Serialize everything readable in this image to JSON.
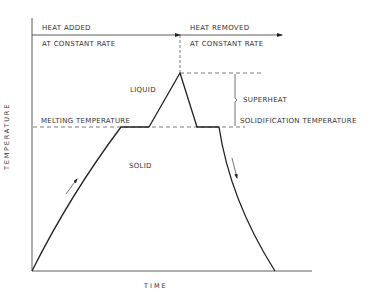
{
  "diagram": {
    "title": "",
    "axes": {
      "x_label": "TIME",
      "y_label": "TEMPERATURE"
    },
    "phases": {
      "heating_top": "HEAT ADDED",
      "heating_bottom": "AT CONSTANT RATE",
      "cooling_top": "HEAT REMOVED",
      "cooling_bottom": "AT CONSTANT RATE"
    },
    "regions": {
      "liquid": "LIQUID",
      "solid": "SOLID"
    },
    "annotations": {
      "melting_temperature": "MELTING TEMPERATURE",
      "superheat": "SUPERHEAT",
      "solidification_temperature": "SOLIDIFICATION TEMPERATURE"
    },
    "curve_points": [
      {
        "stage": "start",
        "x": 32,
        "y": 271
      },
      {
        "stage": "reach-melting",
        "x": 121,
        "y": 127
      },
      {
        "stage": "end-melting-plateau",
        "x": 149,
        "y": 127
      },
      {
        "stage": "peak-superheat",
        "x": 180,
        "y": 73
      },
      {
        "stage": "reach-solidification",
        "x": 197,
        "y": 127
      },
      {
        "stage": "end-solidification-plateau",
        "x": 219,
        "y": 127
      },
      {
        "stage": "end",
        "x": 275,
        "y": 271
      }
    ],
    "colors": {
      "line": "#222222",
      "background": "#ffffff"
    }
  }
}
